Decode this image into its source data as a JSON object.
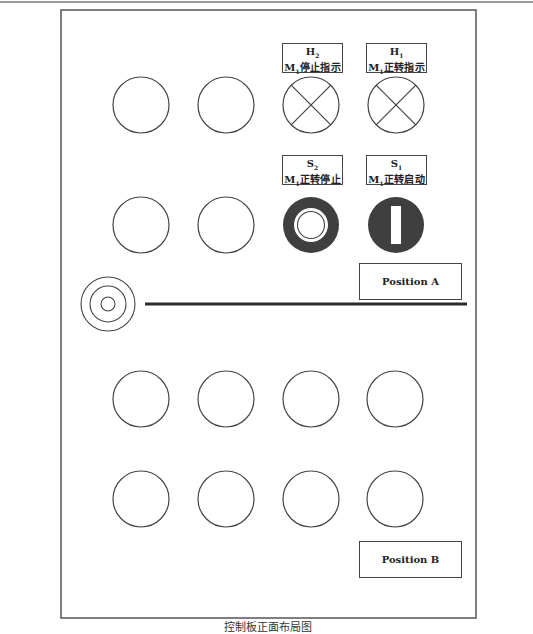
{
  "diagram": {
    "caption": "控制板正面布局图",
    "colors": {
      "frame": "#555555",
      "stroke": "#444444",
      "button_fill": "#3f3f3f",
      "background": "#ffffff"
    },
    "labels": [
      {
        "id": "H2",
        "code_main": "H",
        "code_sub": "2",
        "desc_main": "M",
        "desc_sub": "1",
        "desc_text": "停止指示"
      },
      {
        "id": "H1",
        "code_main": "H",
        "code_sub": "1",
        "desc_main": "M",
        "desc_sub": "1",
        "desc_text": "正转指示"
      },
      {
        "id": "S2",
        "code_main": "S",
        "code_sub": "2",
        "desc_main": "M",
        "desc_sub": "1",
        "desc_text": "正转停止"
      },
      {
        "id": "S1",
        "code_main": "S",
        "code_sub": "1",
        "desc_main": "M",
        "desc_sub": "1",
        "desc_text": "正转启动"
      }
    ],
    "positions": {
      "a": "Position A",
      "b": "Position B"
    },
    "components": {
      "row1": [
        "empty-slot",
        "empty-slot",
        "indicator-lamp H2",
        "indicator-lamp H1"
      ],
      "row2": [
        "empty-slot",
        "empty-slot",
        "stop-button S2",
        "start-button S1"
      ],
      "row3": [
        "empty-slot",
        "empty-slot",
        "empty-slot",
        "empty-slot"
      ],
      "row4": [
        "empty-slot",
        "empty-slot",
        "empty-slot",
        "empty-slot"
      ],
      "side": "concentric-target (rail mount)",
      "rail": "mounting-rail"
    }
  }
}
